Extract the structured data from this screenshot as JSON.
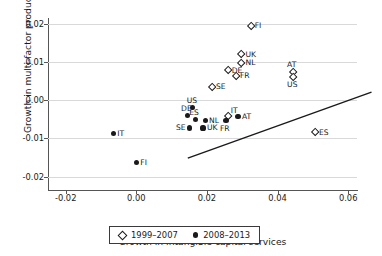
{
  "chart_data": {
    "type": "scatter",
    "title": "",
    "xlabel": "Growth in intangible capital services",
    "ylabel": "Growth in multi-factor productivity",
    "xlim": [
      -0.025,
      0.0625
    ],
    "ylim": [
      -0.0225,
      0.0215
    ],
    "xticks": [
      "-0.02",
      "0.00",
      "0.02",
      "0.04",
      "0.06"
    ],
    "xtick_values": [
      -0.02,
      0.0,
      0.02,
      0.04,
      0.06
    ],
    "yticks": [
      "0.02",
      "0.01",
      "0.00",
      "-0.01",
      "-0.02"
    ],
    "ytick_values": [
      0.02,
      0.01,
      0.0,
      -0.01,
      -0.02
    ],
    "grid": true,
    "legend_position": "bottom-center",
    "series": [
      {
        "name": "1999–2007",
        "marker": "open-diamond",
        "color": "#1a1a1a",
        "points": [
          {
            "label": "FI",
            "x": 0.0324,
            "y": 0.0195,
            "lab_pos": "r"
          },
          {
            "label": "UK",
            "x": 0.0298,
            "y": 0.012,
            "lab_pos": "r"
          },
          {
            "label": "NL",
            "x": 0.0298,
            "y": 0.0098,
            "lab_pos": "r"
          },
          {
            "label": "DE",
            "x": 0.0259,
            "y": 0.0078,
            "lab_pos": "r"
          },
          {
            "label": "FR",
            "x": 0.0282,
            "y": 0.0063,
            "lab_pos": "r"
          },
          {
            "label": "AT",
            "x": 0.0444,
            "y": 0.0073,
            "lab_pos": "t"
          },
          {
            "label": "US",
            "x": 0.0444,
            "y": 0.0061,
            "lab_pos": "b"
          },
          {
            "label": "SE",
            "x": 0.0214,
            "y": 0.0034,
            "lab_pos": "r"
          },
          {
            "label": "IT",
            "x": 0.0259,
            "y": -0.0041,
            "lab_pos": "rt"
          },
          {
            "label": "ES",
            "x": 0.0506,
            "y": -0.0085,
            "lab_pos": "r"
          }
        ]
      },
      {
        "name": "2008–2013",
        "marker": "filled-circle",
        "color": "#1a1a1a",
        "points": [
          {
            "label": "US",
            "x": 0.016,
            "y": -0.002,
            "lab_pos": "t"
          },
          {
            "label": "DE",
            "x": 0.0144,
            "y": -0.0041,
            "lab_pos": "t"
          },
          {
            "label": "ES",
            "x": 0.0167,
            "y": -0.0051,
            "lab_pos": "t"
          },
          {
            "label": "NL",
            "x": 0.0195,
            "y": -0.0054,
            "lab_pos": "r"
          },
          {
            "label": "FR",
            "x": 0.0254,
            "y": -0.0054,
            "lab_pos": "b"
          },
          {
            "label": "AT",
            "x": 0.0288,
            "y": -0.0044,
            "lab_pos": "r"
          },
          {
            "label": "SE",
            "x": 0.0151,
            "y": -0.0073,
            "lab_pos": "l"
          },
          {
            "label": "UK",
            "x": 0.0189,
            "y": -0.0073,
            "lab_pos": "r"
          },
          {
            "label": "IT",
            "x": -0.0065,
            "y": -0.0088,
            "lab_pos": "r"
          },
          {
            "label": "FI",
            "x": 0.0,
            "y": -0.0163,
            "lab_pos": "r"
          }
        ]
      }
    ],
    "trendline": {
      "name": "fit-line",
      "x_start": 0.001,
      "y_start": -0.0105,
      "x_end": 0.053,
      "y_end": 0.0068
    }
  },
  "legend": {
    "items": [
      {
        "marker": "open-diamond",
        "label": "1999–2007"
      },
      {
        "marker": "filled-circle",
        "label": "2008–2013"
      }
    ]
  }
}
